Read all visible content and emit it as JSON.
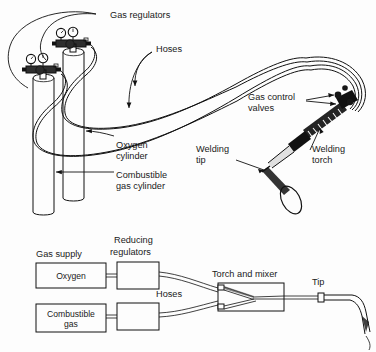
{
  "figure": {
    "title_upper": "Oxyacetylene welding outfit pictorial",
    "title_lower": "Oxyfuel gas welding schematic flow"
  },
  "upper_diagram": {
    "labels": {
      "gas_regulators": "Gas regulators",
      "hoses": "Hoses",
      "gas_control_valves_line1": "Gas control",
      "gas_control_valves_line2": "valves",
      "oxygen_cylinder_line1": "Oxygen",
      "oxygen_cylinder_line2": "cylinder",
      "combustible_line1": "Combustible",
      "combustible_line2": "gas cylinder",
      "welding_tip_line1": "Welding",
      "welding_tip_line2": "tip",
      "welding_torch_line1": "Welding",
      "welding_torch_line2": "torch"
    }
  },
  "lower_diagram": {
    "labels": {
      "gas_supply": "Gas supply",
      "reducing_regulators_line1": "Reducing",
      "reducing_regulators_line2": "regulators",
      "hoses": "Hoses",
      "torch_and_mixer": "Torch and mixer",
      "tip": "Tip"
    },
    "boxes": [
      {
        "name": "oxygen-box",
        "label": "Oxygen",
        "label2": ""
      },
      {
        "name": "combustible-gas-box",
        "label": "Combustible",
        "label2": "gas"
      }
    ]
  },
  "colors": {
    "background": "#fdfdfd",
    "ink": "#111111",
    "text": "#1a1a1a"
  }
}
